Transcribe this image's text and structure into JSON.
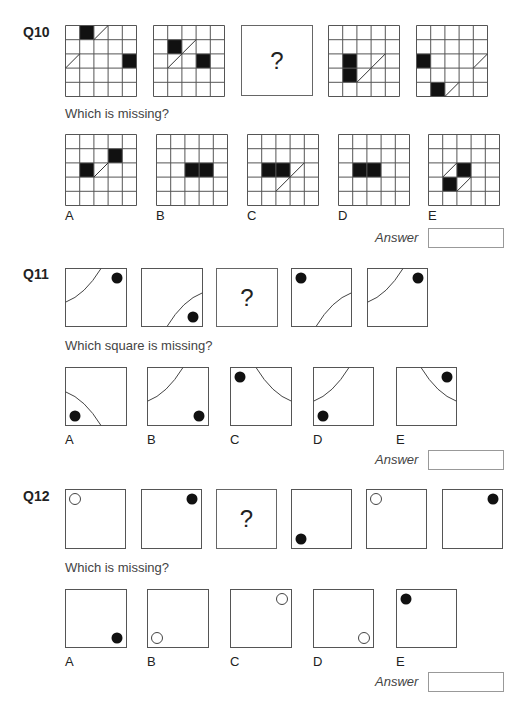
{
  "questions": [
    {
      "id": "Q10",
      "label": "Q10",
      "prompt": "Which is missing?",
      "answer_label": "Answer",
      "answer_value": "",
      "missing_marker": "?",
      "grid_size": 5,
      "sequence": [
        {
          "type": "grid",
          "black": [
            [
              0,
              1
            ],
            [
              2,
              4
            ]
          ],
          "diag": [
            [
              0,
              2
            ],
            [
              2,
              0
            ]
          ]
        },
        {
          "type": "grid",
          "black": [
            [
              1,
              1
            ],
            [
              2,
              3
            ]
          ],
          "diag": [
            [
              1,
              2
            ],
            [
              2,
              1
            ]
          ]
        },
        {
          "type": "missing"
        },
        {
          "type": "grid",
          "black": [
            [
              2,
              1
            ],
            [
              3,
              1
            ]
          ],
          "diag": [
            [
              2,
              3
            ],
            [
              3,
              2
            ]
          ]
        },
        {
          "type": "grid",
          "black": [
            [
              2,
              0
            ],
            [
              4,
              1
            ]
          ],
          "diag": [
            [
              2,
              4
            ],
            [
              4,
              2
            ]
          ]
        }
      ],
      "options": [
        {
          "label": "A",
          "black": [
            [
              1,
              3
            ],
            [
              2,
              1
            ]
          ],
          "diag": [
            [
              2,
              2
            ]
          ]
        },
        {
          "label": "B",
          "black": [
            [
              2,
              2
            ],
            [
              2,
              3
            ]
          ],
          "diag": []
        },
        {
          "label": "C",
          "black": [
            [
              2,
              1
            ],
            [
              2,
              2
            ]
          ],
          "diag": [
            [
              2,
              3
            ],
            [
              3,
              2
            ]
          ]
        },
        {
          "label": "D",
          "black": [
            [
              2,
              1
            ],
            [
              2,
              2
            ]
          ],
          "diag": []
        },
        {
          "label": "E",
          "black": [
            [
              2,
              2
            ],
            [
              3,
              1
            ]
          ],
          "diag": [
            [
              2,
              1
            ],
            [
              3,
              2
            ]
          ]
        }
      ]
    },
    {
      "id": "Q11",
      "label": "Q11",
      "prompt": "Which square is missing?",
      "answer_label": "Answer",
      "answer_value": "",
      "missing_marker": "?",
      "sequence": [
        {
          "type": "arc",
          "arc_corner": "top-left",
          "dot": "top-right"
        },
        {
          "type": "arc",
          "arc_corner": "bottom-right",
          "dot": "bottom-right"
        },
        {
          "type": "missing"
        },
        {
          "type": "arc",
          "arc_corner": "bottom-right",
          "dot": "top-left"
        },
        {
          "type": "arc",
          "arc_corner": "top-left",
          "dot": "top-right"
        }
      ],
      "options": [
        {
          "label": "A",
          "arc_corner": "bottom-left",
          "dot": "bottom-left"
        },
        {
          "label": "B",
          "arc_corner": "top-left",
          "dot": "bottom-right"
        },
        {
          "label": "C",
          "arc_corner": "top-right",
          "dot": "top-left"
        },
        {
          "label": "D",
          "arc_corner": "top-left",
          "dot": "bottom-left"
        },
        {
          "label": "E",
          "arc_corner": "top-right",
          "dot": "top-right"
        }
      ]
    },
    {
      "id": "Q12",
      "label": "Q12",
      "prompt": "Which is missing?",
      "answer_label": "Answer",
      "answer_value": "",
      "missing_marker": "?",
      "sequence": [
        {
          "type": "dot",
          "pos": "top-left",
          "fill": "white"
        },
        {
          "type": "dot",
          "pos": "top-right",
          "fill": "black"
        },
        {
          "type": "missing"
        },
        {
          "type": "dot",
          "pos": "bottom-left",
          "fill": "black"
        },
        {
          "type": "dot",
          "pos": "top-left",
          "fill": "white"
        },
        {
          "type": "dot",
          "pos": "top-right",
          "fill": "black"
        }
      ],
      "options": [
        {
          "label": "A",
          "pos": "bottom-right",
          "fill": "black"
        },
        {
          "label": "B",
          "pos": "bottom-left",
          "fill": "white"
        },
        {
          "label": "C",
          "pos": "top-right",
          "fill": "white"
        },
        {
          "label": "D",
          "pos": "bottom-right",
          "fill": "white"
        },
        {
          "label": "E",
          "pos": "top-left",
          "fill": "black"
        }
      ]
    }
  ]
}
